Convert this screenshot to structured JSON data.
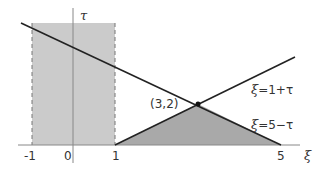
{
  "diagram": {
    "axes": {
      "x_label": "ξ",
      "y_label": "τ",
      "x_ticks": [
        {
          "value": -1,
          "label": "-1"
        },
        {
          "value": 0,
          "label": "0"
        },
        {
          "value": 1,
          "label": "1"
        },
        {
          "value": 5,
          "label": "5"
        }
      ]
    },
    "lines": [
      {
        "label_var": "ξ",
        "label_rest": "=1+τ",
        "equation": "ξ = 1 + τ"
      },
      {
        "label_var": "ξ",
        "label_rest": "=5−τ",
        "equation": "ξ = 5 − τ"
      }
    ],
    "intersection": {
      "label": "(3,2)",
      "x": 3,
      "y": 2
    },
    "regions": [
      {
        "name": "strip",
        "x_range": [
          -1,
          1
        ],
        "color": "#c8c8c8",
        "border": "dashed"
      },
      {
        "name": "triangle",
        "vertices": [
          [
            1,
            0
          ],
          [
            3,
            2
          ],
          [
            5,
            0
          ]
        ],
        "color": "#a8a8a8"
      }
    ],
    "colors": {
      "line": "#222222",
      "axis": "#777777",
      "strip": "#cbcbcb",
      "triangle": "#a9a9a9"
    }
  }
}
